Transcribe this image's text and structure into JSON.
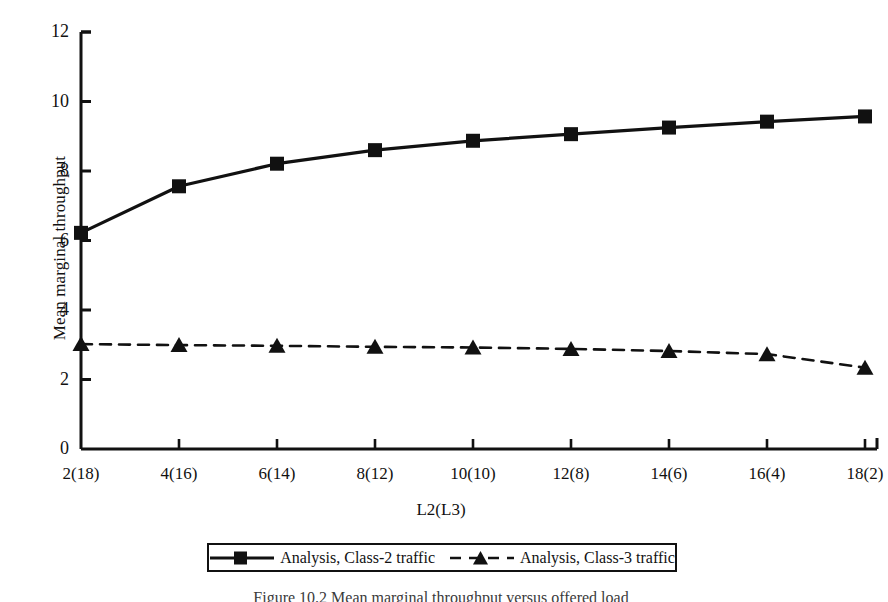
{
  "figure": {
    "caption": "Figure 10.2  Mean marginal throughput versus offered load"
  },
  "chart_data": {
    "type": "line",
    "title": "",
    "xlabel": "L2(L3)",
    "ylabel": "Mean marginal throughput",
    "categories": [
      "2(18)",
      "4(16)",
      "6(14)",
      "8(12)",
      "10(10)",
      "12(8)",
      "14(6)",
      "16(4)",
      "18(2)"
    ],
    "ylim": [
      0,
      12
    ],
    "yticks": [
      0,
      2,
      4,
      6,
      8,
      10,
      12
    ],
    "ytick_labels": [
      "0",
      "2",
      "4",
      "6",
      "8",
      "10",
      "12"
    ],
    "grid": false,
    "legend_position": "bottom",
    "series": [
      {
        "name": "Analysis, Class-2 traffic",
        "marker": "square",
        "linestyle": "solid",
        "color": "#111111",
        "values": [
          6.22,
          7.56,
          8.21,
          8.6,
          8.87,
          9.06,
          9.25,
          9.42,
          9.57
        ]
      },
      {
        "name": "Analysis, Class-3 traffic",
        "marker": "triangle",
        "linestyle": "dashed",
        "color": "#111111",
        "values": [
          3.02,
          2.99,
          2.97,
          2.94,
          2.92,
          2.88,
          2.82,
          2.73,
          2.34
        ]
      }
    ]
  }
}
